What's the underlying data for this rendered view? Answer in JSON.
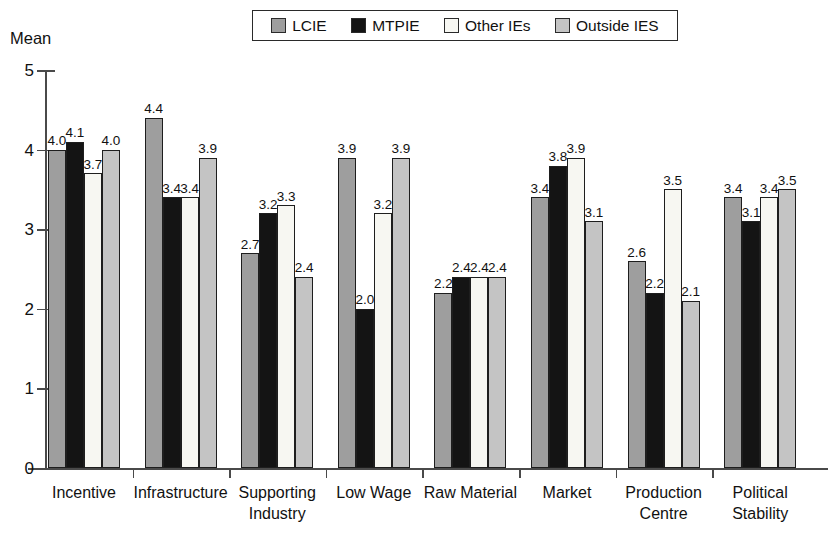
{
  "chart_data": {
    "type": "bar",
    "title": "",
    "subtitle": "",
    "xlabel": "",
    "ylabel": "Mean",
    "ylim": [
      0,
      5
    ],
    "yticks": [
      "0",
      "1",
      "2",
      "3",
      "4",
      "5"
    ],
    "grid": false,
    "legend_position": "top-center",
    "categories": [
      "Incentive",
      "Infrastructure",
      "Supporting\nIndustry",
      "Low Wage",
      "Raw Material",
      "Market",
      "Production\nCentre",
      "Political\nStability"
    ],
    "series": [
      {
        "name": "LCIE",
        "color": "#9e9e9e",
        "values": [
          4.0,
          4.4,
          2.7,
          3.9,
          2.2,
          3.4,
          2.6,
          3.4
        ],
        "labels": [
          "4.0",
          "4.4",
          "2.7",
          "3.9",
          "2.2",
          "3.4",
          "2.6",
          "3.4"
        ]
      },
      {
        "name": "MTPIE",
        "color": "#141414",
        "values": [
          4.1,
          3.4,
          3.2,
          2.0,
          2.4,
          3.8,
          2.2,
          3.1
        ],
        "labels": [
          "4.1",
          "3.4",
          "3.2",
          "2.0",
          "2.4",
          "3.8",
          "2.2",
          "3.1"
        ]
      },
      {
        "name": "Other IEs",
        "color": "#f7f7f2",
        "values": [
          3.7,
          3.4,
          3.3,
          3.2,
          2.4,
          3.9,
          3.5,
          3.4
        ],
        "labels": [
          "3.7",
          "3.4",
          "3.3",
          "3.2",
          "2.4",
          "3.9",
          "3.5",
          "3.4"
        ]
      },
      {
        "name": "Outside IES",
        "color": "#c4c4c4",
        "values": [
          4.0,
          3.9,
          2.4,
          3.9,
          2.4,
          3.1,
          2.1,
          3.5
        ],
        "labels": [
          "4.0",
          "3.9",
          "2.4",
          "3.9",
          "2.4",
          "3.1",
          "2.1",
          "3.5"
        ]
      }
    ]
  },
  "legend": {
    "items": [
      {
        "label": "LCIE",
        "color": "#9e9e9e"
      },
      {
        "label": "MTPIE",
        "color": "#141414"
      },
      {
        "label": "Other IEs",
        "color": "#f7f7f2"
      },
      {
        "label": "Outside IES",
        "color": "#c4c4c4"
      }
    ]
  },
  "axis": {
    "y_title": "Mean"
  }
}
